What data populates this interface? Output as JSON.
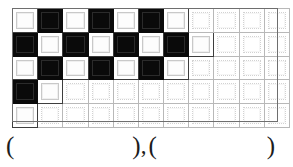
{
  "figure": {
    "type": "checkerboard-grid",
    "columns": 11,
    "rows": 5,
    "legend": {
      "black_label": "black square",
      "white_label": "white square",
      "faint_label": "empty square"
    },
    "grid": [
      [
        "white",
        "black",
        "white",
        "black",
        "white",
        "black",
        "white",
        "faint",
        "faint",
        "faint",
        "faint"
      ],
      [
        "black",
        "white",
        "black",
        "white",
        "black",
        "white",
        "black",
        "white",
        "faint",
        "faint",
        "faint"
      ],
      [
        "white",
        "black",
        "white",
        "black",
        "white",
        "black",
        "white",
        "faint",
        "faint",
        "faint",
        "faint"
      ],
      [
        "black",
        "white",
        "faint",
        "faint",
        "faint",
        "faint",
        "faint",
        "faint",
        "faint",
        "faint",
        "faint"
      ],
      [
        "white",
        "faint",
        "faint",
        "faint",
        "faint",
        "faint",
        "faint",
        "faint",
        "faint",
        "faint",
        "faint"
      ]
    ],
    "counts": {
      "black": 12,
      "white": 13,
      "faint": 30,
      "total": 55
    }
  },
  "answer_line": {
    "open_paren": "(",
    "close_paren": ")",
    "separator": ",",
    "first_answer": "",
    "second_answer": ""
  },
  "colors": {
    "black_cell": "#0a0a0a",
    "white_cell": "#ffffff",
    "white_cell_border": "#3d3d3d",
    "faint_cell_border": "#b8b8b8",
    "figure_border": "#6e6e6e",
    "text": "#1c1c1c",
    "page_background": "#ffffff"
  }
}
